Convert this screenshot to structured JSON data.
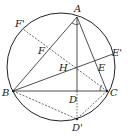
{
  "diagram": {
    "type": "geometry",
    "circle": {
      "cx": 61,
      "cy": 67,
      "r": 54
    },
    "points": {
      "A": {
        "x": 77,
        "y": 17,
        "label": "A"
      },
      "B": {
        "x": 13,
        "y": 91,
        "label": "B"
      },
      "C": {
        "x": 107,
        "y": 91,
        "label": "C"
      },
      "D": {
        "x": 77,
        "y": 91,
        "label": "D"
      },
      "E": {
        "x": 96,
        "y": 62,
        "label": "E"
      },
      "F": {
        "x": 47,
        "y": 47,
        "label": "F"
      },
      "H": {
        "x": 77,
        "y": 69,
        "label": "H"
      },
      "D_prime": {
        "x": 77,
        "y": 119,
        "label": "D'"
      },
      "E_prime": {
        "x": 113,
        "y": 54,
        "label": "E'"
      },
      "F_prime": {
        "x": 23,
        "y": 29,
        "label": "F'"
      }
    },
    "solid_segments": [
      [
        "A",
        "B"
      ],
      [
        "A",
        "C"
      ],
      [
        "B",
        "C"
      ],
      [
        "A",
        "D"
      ],
      [
        "B",
        "E_prime"
      ]
    ],
    "dashed_segments": [
      [
        "C",
        "F_prime"
      ],
      [
        "B",
        "D_prime"
      ],
      [
        "C",
        "D_prime"
      ],
      [
        "D",
        "D_prime"
      ]
    ],
    "angle_marks": [
      "A",
      "C"
    ]
  }
}
